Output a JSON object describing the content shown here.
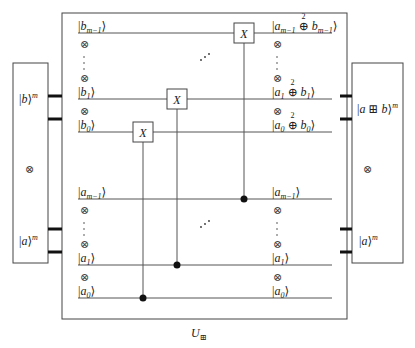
{
  "diagram": {
    "type": "quantum-circuit",
    "caption": {
      "main": "U",
      "sub": "⊞"
    },
    "tensor_symbol": "⊗",
    "vdots": "⋮",
    "ddots": "⋰",
    "gate_label": "X",
    "left_block": {
      "top_label": {
        "ket": "b",
        "sup": "m"
      },
      "middle": "⊗",
      "bottom_label": {
        "ket": "a",
        "sup": "m"
      }
    },
    "right_block": {
      "top_label": {
        "ket": "a ⊞ b",
        "sup": "m"
      },
      "middle": "⊗",
      "bottom_label": {
        "ket": "a",
        "sup": "m"
      }
    },
    "wires": [
      {
        "id": "b_m-1",
        "in": {
          "var": "b",
          "sub": "m−1"
        },
        "out": {
          "a": "a",
          "a_sub": "m−1",
          "op": "⊕",
          "op_sup": "2",
          "b": "b",
          "b_sub": "m−1"
        }
      },
      {
        "id": "b_1",
        "in": {
          "var": "b",
          "sub": "1"
        },
        "out": {
          "a": "a",
          "a_sub": "1",
          "op": "⊕",
          "op_sup": "2",
          "b": "b",
          "b_sub": "1"
        }
      },
      {
        "id": "b_0",
        "in": {
          "var": "b",
          "sub": "0"
        },
        "out": {
          "a": "a",
          "a_sub": "0",
          "op": "⊕",
          "op_sup": "2",
          "b": "b",
          "b_sub": "0"
        }
      },
      {
        "id": "a_m-1",
        "in": {
          "var": "a",
          "sub": "m−1"
        },
        "out": {
          "var": "a",
          "sub": "m−1"
        }
      },
      {
        "id": "a_1",
        "in": {
          "var": "a",
          "sub": "1"
        },
        "out": {
          "var": "a",
          "sub": "1"
        }
      },
      {
        "id": "a_0",
        "in": {
          "var": "a",
          "sub": "0"
        },
        "out": {
          "var": "a",
          "sub": "0"
        }
      }
    ],
    "gates": [
      {
        "type": "CNOT",
        "control": "a_0",
        "target": "b_0"
      },
      {
        "type": "CNOT",
        "control": "a_1",
        "target": "b_1"
      },
      {
        "type": "CNOT",
        "control": "a_m-1",
        "target": "b_m-1"
      }
    ]
  }
}
